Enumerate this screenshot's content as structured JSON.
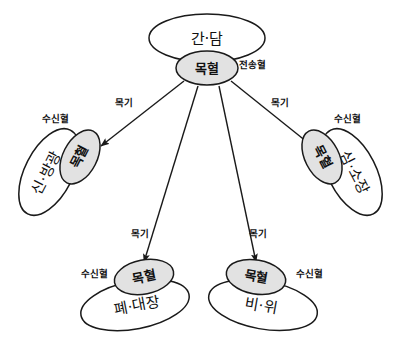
{
  "diagram": {
    "colors": {
      "background": "#ffffff",
      "stroke": "#1a1a1a",
      "organ_fill": "#ffffff",
      "point_fill": "#e2e2e2",
      "text": "#111111"
    },
    "source": {
      "organ_label": "간·담",
      "point_label": "목혈",
      "annotation": "전송혈"
    },
    "targets": [
      {
        "id": "left",
        "organ_label": "신·방광",
        "point_label": "목혈",
        "annotation": "수신혈",
        "edge_label": "목기"
      },
      {
        "id": "right",
        "organ_label": "심·소장",
        "point_label": "목혈",
        "annotation": "수신혈",
        "edge_label": "목기"
      },
      {
        "id": "bottom-left",
        "organ_label": "폐·대장",
        "point_label": "목혈",
        "annotation": "수신혈",
        "edge_label": "목기"
      },
      {
        "id": "bottom-right",
        "organ_label": "비·위",
        "point_label": "목혈",
        "annotation": "수신혈",
        "edge_label": "목기"
      }
    ]
  }
}
